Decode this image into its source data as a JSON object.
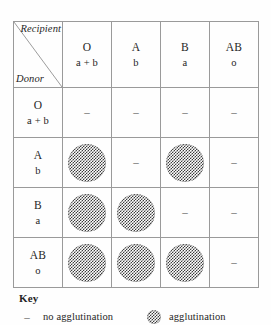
{
  "table": {
    "corner": {
      "recipient_label": "Recipient",
      "donor_label": "Donor",
      "diagonal_icon": "diagonal-divider-line"
    },
    "column_headers": [
      {
        "group": "O",
        "antibodies": "a + b"
      },
      {
        "group": "A",
        "antibodies": "b"
      },
      {
        "group": "B",
        "antibodies": "a"
      },
      {
        "group": "AB",
        "antibodies": "o"
      }
    ],
    "row_headers": [
      {
        "group": "O",
        "antibodies": "a + b"
      },
      {
        "group": "A",
        "antibodies": "b"
      },
      {
        "group": "B",
        "antibodies": "a"
      },
      {
        "group": "AB",
        "antibodies": "o"
      }
    ],
    "dash_symbol": "–",
    "cells": [
      [
        "dash",
        "dash",
        "dash",
        "dash"
      ],
      [
        "circle",
        "dash",
        "circle",
        "dash"
      ],
      [
        "circle",
        "circle",
        "dash",
        "dash"
      ],
      [
        "circle",
        "circle",
        "circle",
        "dash"
      ]
    ]
  },
  "key": {
    "title": "Key",
    "entries": [
      {
        "symbol": "dash",
        "symbol_text": "–",
        "label": "no agglutination"
      },
      {
        "symbol": "circle",
        "symbol_text": "",
        "label": "agglutination"
      }
    ]
  },
  "colors": {
    "page_background": "#fefefe",
    "grid_line": "#9a9a9a",
    "text": "#262626",
    "pattern_dark": "#3c3c3c",
    "pattern_light": "#ffffff"
  }
}
